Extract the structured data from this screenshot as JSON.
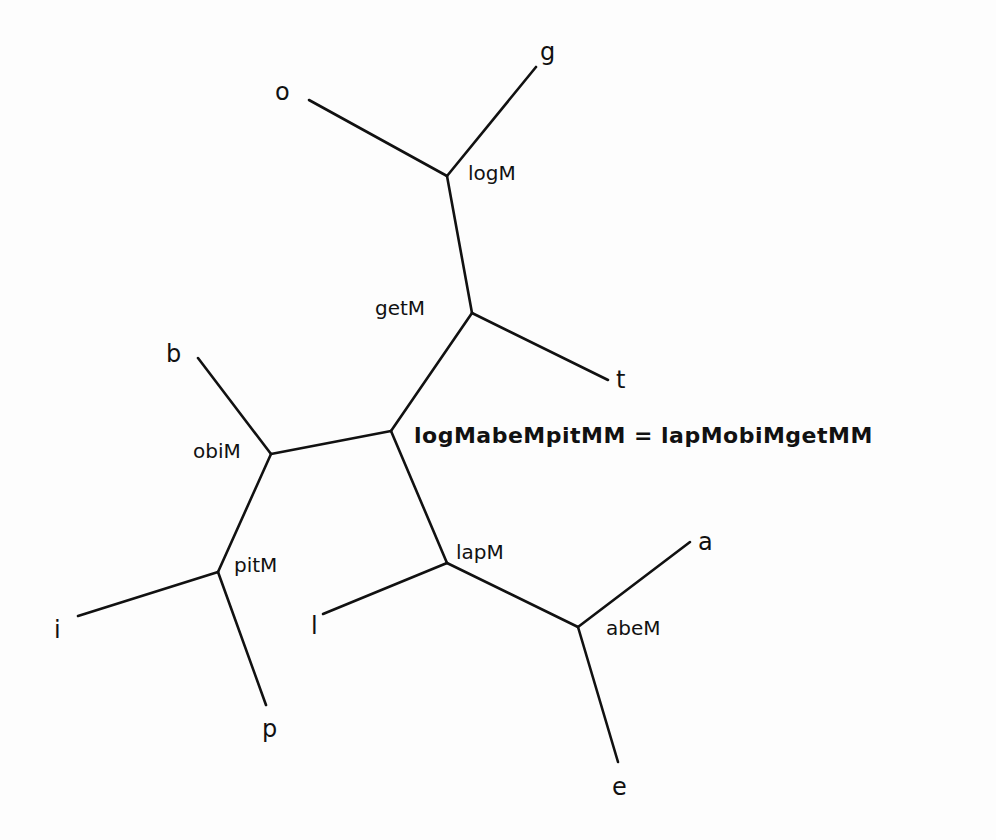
{
  "diagram": {
    "type": "unrooted tree",
    "equation": "logMabeMpitMM = lapMobiMgetMM",
    "internal_nodes": [
      {
        "id": "logM",
        "label": "logM",
        "x": 447,
        "y": 176
      },
      {
        "id": "getM",
        "label": "getM",
        "x": 472,
        "y": 313
      },
      {
        "id": "root",
        "label": "logMabeMpitMM = lapMobiMgetMM",
        "x": 391,
        "y": 431
      },
      {
        "id": "obiM",
        "label": "obiM",
        "x": 271,
        "y": 454
      },
      {
        "id": "pitM",
        "label": "pitM",
        "x": 218,
        "y": 572
      },
      {
        "id": "lapM",
        "label": "lapM",
        "x": 447,
        "y": 563
      },
      {
        "id": "abeM",
        "label": "abeM",
        "x": 578,
        "y": 627
      }
    ],
    "leaves": [
      {
        "id": "o",
        "label": "o"
      },
      {
        "id": "g",
        "label": "g"
      },
      {
        "id": "t",
        "label": "t"
      },
      {
        "id": "b",
        "label": "b"
      },
      {
        "id": "i",
        "label": "i"
      },
      {
        "id": "p",
        "label": "p"
      },
      {
        "id": "l",
        "label": "l"
      },
      {
        "id": "a",
        "label": "a"
      },
      {
        "id": "e",
        "label": "e"
      }
    ],
    "edges": [
      [
        "o",
        "logM"
      ],
      [
        "g",
        "logM"
      ],
      [
        "logM",
        "getM"
      ],
      [
        "getM",
        "t"
      ],
      [
        "getM",
        "root"
      ],
      [
        "root",
        "obiM"
      ],
      [
        "obiM",
        "b"
      ],
      [
        "obiM",
        "pitM"
      ],
      [
        "pitM",
        "i"
      ],
      [
        "pitM",
        "p"
      ],
      [
        "root",
        "lapM"
      ],
      [
        "lapM",
        "l"
      ],
      [
        "lapM",
        "abeM"
      ],
      [
        "abeM",
        "a"
      ],
      [
        "abeM",
        "e"
      ]
    ]
  },
  "labels": {
    "o": "o",
    "g": "g",
    "t": "t",
    "b": "b",
    "i": "i",
    "p": "p",
    "l": "l",
    "a": "a",
    "e": "e",
    "logM": "logM",
    "getM": "getM",
    "obiM": "obiM",
    "pitM": "pitM",
    "lapM": "lapM",
    "abeM": "abeM",
    "equation": "logMabeMpitMM = lapMobiMgetMM"
  }
}
